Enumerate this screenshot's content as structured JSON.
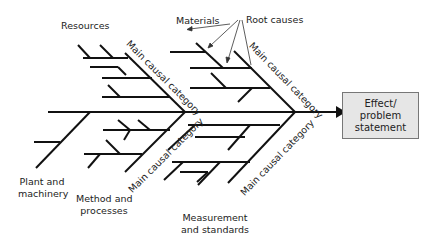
{
  "diagram": {
    "type": "fishbone (Ishikawa) cause-and-effect diagram",
    "effect_box": {
      "line1": "Effect/",
      "line2": "problem",
      "line3": "statement",
      "fill": "#e6e6e6"
    },
    "categories": {
      "resources": "Resources",
      "plant_machinery": {
        "line1": "Plant and",
        "line2": "machinery"
      },
      "method_processes": {
        "line1": "Method and",
        "line2": "processes"
      },
      "measurement_standards": {
        "line1": "Measurement",
        "line2": "and standards"
      }
    },
    "bone_label": "Main causal category",
    "annotations": {
      "materials": "Materials",
      "root_causes": "Root causes"
    },
    "line_color": "#111111"
  }
}
